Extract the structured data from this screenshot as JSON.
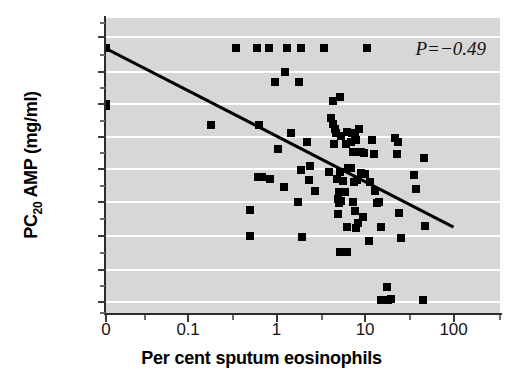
{
  "figure": {
    "annotation": "P=−0.49",
    "annotation_symbol": "P",
    "annotation_value": "=−0.49",
    "background_color": "#d7d7d7",
    "gridline_color": "#ffffff",
    "marker_color": "#000000",
    "line_color": "#000000"
  },
  "chart_data": {
    "type": "scatter",
    "title": "",
    "xlabel": "Per cent sputum eosinophils",
    "ylabel": "PC20 AMP (mg/ml)",
    "ylabel_parts": {
      "prefix": "PC",
      "sub": "20",
      "suffix": " AMP (mg/ml)"
    },
    "xscale": "log",
    "yscale": "log",
    "xlim": [
      0.025,
      316
    ],
    "ylim": [
      0.014,
      1700
    ],
    "xticks": [
      0,
      0.1,
      1,
      10,
      100
    ],
    "xtick_labels": [
      "0",
      "0.1",
      "1",
      "10",
      "100"
    ],
    "yticks": [
      0.02,
      0.05,
      0.25,
      1,
      4,
      16,
      64,
      256,
      1000
    ],
    "ytick_labels": [
      "0.02",
      "0.05",
      "0.25",
      "1",
      "4",
      "16",
      "64",
      "256",
      "1000"
    ],
    "grid": "horizontal",
    "legend": "none",
    "annotations": [
      {
        "text": "P=−0.49",
        "position": "top-right"
      }
    ],
    "fit_line": {
      "label": "regression line",
      "x_start": 0.03,
      "y_start": 640,
      "x_end": 100,
      "y_end": 0.36
    },
    "series": [
      {
        "name": "patients",
        "marker": "square",
        "n": 104,
        "points": [
          [
            0.03,
            640
          ],
          [
            0.03,
            64
          ],
          [
            0.03,
            58
          ],
          [
            0.35,
            640
          ],
          [
            0.6,
            640
          ],
          [
            0.82,
            640
          ],
          [
            1.3,
            640
          ],
          [
            1.9,
            640
          ],
          [
            3.4,
            640
          ],
          [
            10.5,
            640
          ],
          [
            1.25,
            256
          ],
          [
            0.95,
            165
          ],
          [
            1.8,
            165
          ],
          [
            4.4,
            72
          ],
          [
            5.2,
            85
          ],
          [
            0.18,
            26
          ],
          [
            0.63,
            26
          ],
          [
            1.45,
            19
          ],
          [
            4.1,
            36
          ],
          [
            4.3,
            28
          ],
          [
            4.6,
            22
          ],
          [
            4.7,
            19
          ],
          [
            5.4,
            17
          ],
          [
            6.2,
            20
          ],
          [
            7.2,
            19
          ],
          [
            7.8,
            17
          ],
          [
            8.5,
            22
          ],
          [
            2.2,
            13
          ],
          [
            4.5,
            12
          ],
          [
            6.1,
            12
          ],
          [
            6.9,
            13
          ],
          [
            8.0,
            14
          ],
          [
            12.0,
            14
          ],
          [
            22.0,
            15
          ],
          [
            23.5,
            13
          ],
          [
            1.05,
            9.5
          ],
          [
            7.4,
            8.5
          ],
          [
            8.9,
            8.5
          ],
          [
            9.8,
            8.0
          ],
          [
            12.6,
            7.5
          ],
          [
            23.0,
            7.5
          ],
          [
            46.0,
            6.5
          ],
          [
            2.4,
            4.6
          ],
          [
            5.2,
            3.6
          ],
          [
            6.4,
            4.2
          ],
          [
            7.0,
            4.1
          ],
          [
            9.0,
            3.4
          ],
          [
            10.0,
            3.3
          ],
          [
            1.9,
            3.8
          ],
          [
            3.9,
            3.6
          ],
          [
            0.62,
            2.9
          ],
          [
            0.68,
            2.9
          ],
          [
            0.85,
            2.6
          ],
          [
            2.3,
            2.5
          ],
          [
            4.8,
            2.6
          ],
          [
            5.6,
            2.4
          ],
          [
            7.6,
            2.3
          ],
          [
            8.2,
            2.5
          ],
          [
            11.5,
            2.3
          ],
          [
            36.0,
            3.1
          ],
          [
            1.2,
            1.9
          ],
          [
            2.7,
            1.6
          ],
          [
            5.1,
            1.55
          ],
          [
            5.9,
            1.5
          ],
          [
            13.0,
            1.6
          ],
          [
            38.0,
            1.7
          ],
          [
            1.75,
            1.0
          ],
          [
            5.0,
            1.15
          ],
          [
            5.1,
            0.95
          ],
          [
            5.3,
            1.05
          ],
          [
            7.3,
            1.0
          ],
          [
            13.5,
            0.95
          ],
          [
            14.5,
            1.0
          ],
          [
            0.5,
            0.72
          ],
          [
            5.0,
            0.62
          ],
          [
            7.8,
            0.68
          ],
          [
            9.5,
            0.55
          ],
          [
            24.0,
            0.65
          ],
          [
            6.3,
            0.36
          ],
          [
            7.9,
            0.34
          ],
          [
            8.3,
            0.42
          ],
          [
            15.0,
            0.36
          ],
          [
            48.0,
            0.37
          ],
          [
            0.5,
            0.25
          ],
          [
            1.95,
            0.24
          ],
          [
            25.5,
            0.23
          ],
          [
            11.0,
            0.2
          ],
          [
            5.2,
            0.12
          ],
          [
            6.2,
            0.12
          ],
          [
            17.5,
            0.031
          ],
          [
            15.0,
            0.021
          ],
          [
            18.0,
            0.021
          ],
          [
            19.5,
            0.022
          ],
          [
            45.0,
            0.021
          ]
        ]
      }
    ]
  }
}
